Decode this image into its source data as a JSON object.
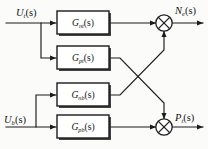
{
  "diagram": {
    "type": "control-block-diagram",
    "colors": {
      "background": "#fbfbfa",
      "line": "#1b1b1b",
      "block_fill": "#ffffff",
      "shadow": "#2a2a2a"
    },
    "inputs": [
      {
        "id": "u-t",
        "base": "U",
        "sub": "t",
        "arg": "(s)",
        "full": "U_t(s)"
      },
      {
        "id": "u-b",
        "base": "U",
        "sub": "b",
        "arg": "(s)",
        "full": "U_b(s)"
      }
    ],
    "outputs": [
      {
        "id": "n-e",
        "base": "N",
        "sub": "e",
        "arg": "(s)",
        "full": "N_e(s)"
      },
      {
        "id": "p-t",
        "base": "P",
        "sub": "t",
        "arg": "(s)",
        "full": "P_t(s)"
      }
    ],
    "blocks": [
      {
        "id": "g-nt",
        "base": "G",
        "sub": "nt",
        "arg": "(s)",
        "full": "G_nt(s)",
        "source": "U_t(s)",
        "target": "sum-top"
      },
      {
        "id": "g-pt",
        "base": "G",
        "sub": "pt",
        "arg": "(s)",
        "full": "G_pt(s)",
        "source": "U_t(s)",
        "target": "sum-bottom"
      },
      {
        "id": "g-nb",
        "base": "G",
        "sub": "nb",
        "arg": "(s)",
        "full": "G_nb(s)",
        "source": "U_b(s)",
        "target": "sum-top"
      },
      {
        "id": "g-pb",
        "base": "G",
        "sub": "pb",
        "arg": "(s)",
        "full": "G_pb(s)",
        "source": "U_b(s)",
        "target": "sum-bottom"
      }
    ],
    "summing_junctions": [
      {
        "id": "sum-top",
        "glyph": "crossed-circle",
        "output": "N_e(s)"
      },
      {
        "id": "sum-bottom",
        "glyph": "crossed-circle",
        "output": "P_t(s)"
      }
    ]
  }
}
